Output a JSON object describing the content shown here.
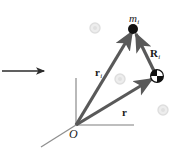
{
  "figure": {
    "name": "rigid-body-position-vector-diagram",
    "background_color": "#ffffff",
    "width": 180,
    "height": 154
  },
  "colors": {
    "vector_stroke": "#595959",
    "axis_stroke": "#a8a8a8",
    "marker_fill": "#111111",
    "label_text": "#1a1a1a",
    "watermark": "#e2e2e2",
    "pointer_arrow": "#2b2b2b"
  },
  "labels": {
    "mass_point": {
      "base": "m",
      "sub": "i"
    },
    "vector_ri_body": {
      "base": "r",
      "sub": "i"
    },
    "vector_R_body": {
      "base": "R",
      "sub": "i"
    },
    "vector_r_cm": {
      "base": "r",
      "sub": ""
    },
    "origin": "O"
  },
  "geometry": {
    "origin_point": {
      "x": 76,
      "y": 125
    },
    "mass_point": {
      "x": 133,
      "y": 29
    },
    "center_of_mass_point": {
      "x": 157,
      "y": 76
    },
    "axes": {
      "vertical_axis": {
        "x1": 76,
        "y1": 125,
        "x2": 76,
        "y2": 78
      },
      "horizontal_axis": {
        "x1": 76,
        "y1": 125,
        "x2": 133,
        "y2": 125
      },
      "depth_axis": {
        "x1": 76,
        "y1": 125,
        "x2": 42,
        "y2": 147
      }
    },
    "vectors": [
      {
        "name": "r_i",
        "x1": 76,
        "y1": 125,
        "x2": 133,
        "y2": 30
      },
      {
        "name": "r",
        "x1": 76,
        "y1": 125,
        "x2": 155,
        "y2": 77
      },
      {
        "name": "R_i",
        "x1": 155,
        "y1": 75,
        "x2": 134,
        "y2": 31
      }
    ],
    "pointer_arrow": {
      "x1": 2,
      "y1": 71,
      "x2": 46,
      "y2": 71
    },
    "watermarks": [
      {
        "x": 95,
        "y": 28,
        "r": 5
      },
      {
        "x": 120,
        "y": 79,
        "r": 5
      },
      {
        "x": 163,
        "y": 110,
        "r": 5
      }
    ]
  },
  "label_positions": {
    "mass_point": {
      "left": 129,
      "top": 9
    },
    "vector_ri_body": {
      "left": 95,
      "top": 63
    },
    "vector_R_body": {
      "left": 150,
      "top": 44
    },
    "vector_r_cm": {
      "left": 122,
      "top": 103
    },
    "origin": {
      "left": 69,
      "top": 128
    }
  },
  "icons": {
    "mass_marker": "filled-circle-icon",
    "center-of-mass": "center-of-mass-quadrant-icon",
    "pointer": "right-arrow-icon"
  }
}
